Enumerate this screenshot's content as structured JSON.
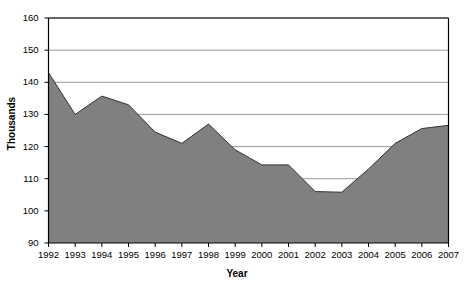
{
  "chart_data": {
    "type": "area",
    "title": "",
    "xlabel": "Year",
    "ylabel": "Thousands",
    "categories": [
      "1992",
      "1993",
      "1994",
      "1995",
      "1996",
      "1997",
      "1998",
      "1999",
      "2000",
      "2001",
      "2002",
      "2003",
      "2004",
      "2005",
      "2006",
      "2007"
    ],
    "values": [
      143,
      130,
      135.7,
      133,
      124.5,
      121,
      127,
      119,
      114.3,
      114.3,
      106,
      105.8,
      113,
      121,
      125.6,
      126.6
    ],
    "series": [
      {
        "name": "Thousands",
        "values": [
          143,
          130,
          135.7,
          133,
          124.5,
          121,
          127,
          119,
          114.3,
          114.3,
          106,
          105.8,
          113,
          121,
          125.6,
          126.6
        ]
      }
    ],
    "ylim": [
      90,
      160
    ],
    "ytick_values": [
      90,
      100,
      110,
      120,
      130,
      140,
      150,
      160
    ],
    "ytick_labels": [
      "90",
      "100",
      "110",
      "120",
      "130",
      "140",
      "150",
      "160"
    ],
    "xtick_labels": [
      "1992",
      "1993",
      "1994",
      "1995",
      "1996",
      "1997",
      "1998",
      "1999",
      "2000",
      "2001",
      "2002",
      "2003",
      "2004",
      "2005",
      "2006",
      "2007"
    ],
    "grid": true,
    "grid_axis": "y",
    "legend": false,
    "legend_position": "none",
    "area_fill_color": "#808080",
    "line_color": "#333333",
    "grid_color": "#808080",
    "axis_color": "#000000",
    "background_color": "#ffffff"
  },
  "axis_titles": {
    "y": "Thousands",
    "x": "Year"
  }
}
